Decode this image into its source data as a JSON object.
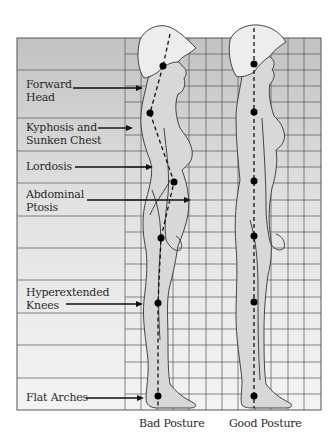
{
  "diagram": {
    "labels": [
      {
        "line1": "Forward",
        "line2": "Head"
      },
      {
        "line1": "Kyphosis and",
        "line2": "Sunken Chest"
      },
      {
        "line1": "Lordosis",
        "line2": ""
      },
      {
        "line1": "Abdominal",
        "line2": "Ptosis"
      },
      {
        "line1": "Hyperextended",
        "line2": "Knees"
      },
      {
        "line1": "Flat Arches",
        "line2": ""
      }
    ],
    "captions": {
      "bad": "Bad Posture",
      "good": "Good Posture"
    },
    "colors": {
      "grid_top": "#c4c4c4",
      "grid_bottom": "#f2f2f2",
      "body_fill": "#d9d9d9",
      "hair_fill": "#ededed",
      "line": "#333333",
      "dot": "#000000"
    },
    "bad_posture_points": [
      [
        163,
        66
      ],
      [
        150,
        113
      ],
      [
        174,
        182
      ],
      [
        161,
        238
      ],
      [
        158,
        303
      ],
      [
        158,
        396
      ]
    ],
    "good_posture_points": [
      [
        254,
        64
      ],
      [
        254,
        112
      ],
      [
        254,
        181
      ],
      [
        254,
        236
      ],
      [
        254,
        302
      ],
      [
        254,
        396
      ]
    ]
  }
}
